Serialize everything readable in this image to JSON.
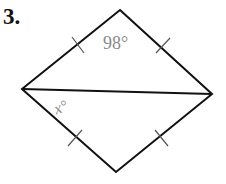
{
  "problem": {
    "number": "3.",
    "angle_top_label": "98°",
    "angle_x_label": "x°"
  },
  "figure": {
    "type": "rhombus with diagonal",
    "vertices": {
      "top": [
        120,
        10
      ],
      "left": [
        22,
        89
      ],
      "right": [
        212,
        94
      ],
      "bottom": [
        116,
        172
      ]
    },
    "congruent_side_marks": 4,
    "line_color": "#111111",
    "label_color": "#8a8a8a"
  }
}
